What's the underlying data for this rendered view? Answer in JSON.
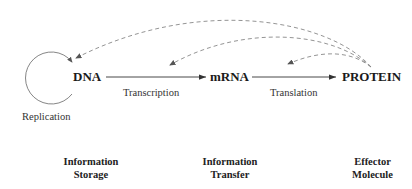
{
  "nodes": {
    "dna": "DNA",
    "mrna": "mRNA",
    "protein": "PROTEIN"
  },
  "processes": {
    "replication": "Replication",
    "transcription": "Transcription",
    "translation": "Translation"
  },
  "roles": {
    "storage": {
      "line1": "Information",
      "line2": "Storage"
    },
    "transfer": {
      "line1": "Information",
      "line2": "Transfer"
    },
    "effector": {
      "line1": "Effector",
      "line2": "Molecule"
    }
  },
  "colors": {
    "solid_arrow": "#333333",
    "dashed_arrow": "#888888",
    "text": "#222222"
  }
}
